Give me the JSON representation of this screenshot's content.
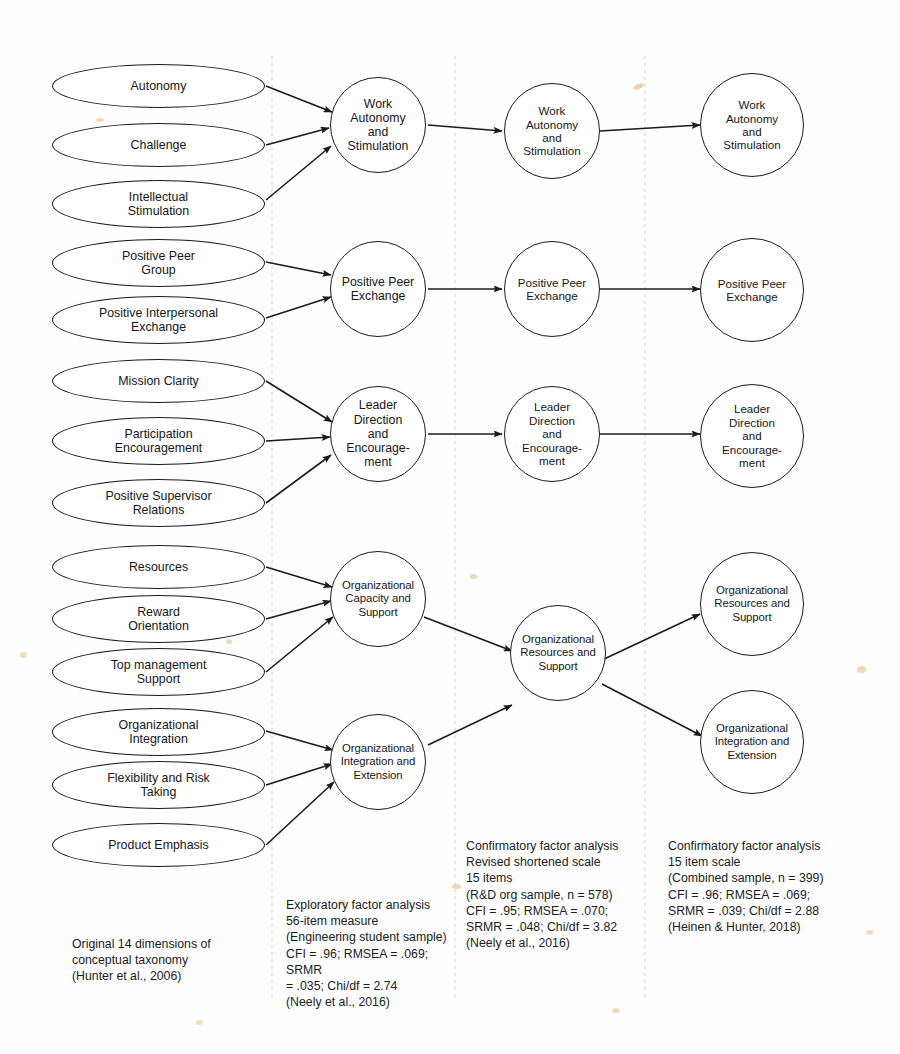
{
  "figure": {
    "type": "path-diagram",
    "title_clipped_top": "",
    "background": "#fefefe",
    "stroke_color": "#1a1a1a",
    "divider_color": "#d9d9d9"
  },
  "columns": [
    {
      "id": "col1",
      "label": "Original 14 dimensions of conceptual taxonomy"
    },
    {
      "id": "col2",
      "label": "Exploratory factor analysis"
    },
    {
      "id": "col3",
      "label": "Confirmatory factor analysis - revised shortened scale"
    },
    {
      "id": "col4",
      "label": "Confirmatory factor analysis - 15 item scale"
    }
  ],
  "dimensions": [
    {
      "id": "d1",
      "label": "Autonomy",
      "x": 52,
      "y": 64,
      "w": 213,
      "h": 44
    },
    {
      "id": "d2",
      "label": "Challenge",
      "x": 52,
      "y": 123,
      "w": 213,
      "h": 44
    },
    {
      "id": "d3",
      "label": "Intellectual\nStimulation",
      "x": 52,
      "y": 180,
      "w": 213,
      "h": 48
    },
    {
      "id": "d4",
      "label": "Positive Peer\nGroup",
      "x": 52,
      "y": 239,
      "w": 213,
      "h": 48
    },
    {
      "id": "d5",
      "label": "Positive Interpersonal\nExchange",
      "x": 52,
      "y": 296,
      "w": 213,
      "h": 48
    },
    {
      "id": "d6",
      "label": "Mission Clarity",
      "x": 52,
      "y": 359,
      "w": 213,
      "h": 44
    },
    {
      "id": "d7",
      "label": "Participation\nEncouragement",
      "x": 52,
      "y": 417,
      "w": 213,
      "h": 48
    },
    {
      "id": "d8",
      "label": "Positive Supervisor\nRelations",
      "x": 52,
      "y": 479,
      "w": 213,
      "h": 48
    },
    {
      "id": "d9",
      "label": "Resources",
      "x": 52,
      "y": 545,
      "w": 213,
      "h": 44
    },
    {
      "id": "d10",
      "label": "Reward\nOrientation",
      "x": 52,
      "y": 595,
      "w": 213,
      "h": 48
    },
    {
      "id": "d11",
      "label": "Top management\nSupport",
      "x": 52,
      "y": 648,
      "w": 213,
      "h": 48
    },
    {
      "id": "d12",
      "label": "Organizational\nIntegration",
      "x": 52,
      "y": 708,
      "w": 213,
      "h": 48
    },
    {
      "id": "d13",
      "label": "Flexibility and Risk\nTaking",
      "x": 52,
      "y": 761,
      "w": 213,
      "h": 48
    },
    {
      "id": "d14",
      "label": "Product Emphasis",
      "x": 52,
      "y": 823,
      "w": 213,
      "h": 44
    }
  ],
  "efa_factors": [
    {
      "id": "e1",
      "label": "Work\nAutonomy\nand\nStimulation",
      "x": 330,
      "y": 77,
      "size": 96
    },
    {
      "id": "e2",
      "label": "Positive Peer\nExchange",
      "x": 330,
      "y": 241,
      "size": 96
    },
    {
      "id": "e3",
      "label": "Leader\nDirection\nand\nEncourage-\nment",
      "x": 330,
      "y": 386,
      "size": 96
    },
    {
      "id": "e4",
      "label": "Organizational\nCapacity and\nSupport",
      "x": 330,
      "y": 551,
      "size": 96
    },
    {
      "id": "e5",
      "label": "Organizational\nIntegration and\nExtension",
      "x": 330,
      "y": 714,
      "size": 96
    }
  ],
  "cfa1_factors": [
    {
      "id": "c1",
      "label": "Work\nAutonomy\nand\nStimulation",
      "x": 504,
      "y": 83,
      "size": 96
    },
    {
      "id": "c2",
      "label": "Positive Peer\nExchange",
      "x": 504,
      "y": 241,
      "size": 96
    },
    {
      "id": "c3",
      "label": "Leader\nDirection\nand\nEncourage-\nment",
      "x": 504,
      "y": 386,
      "size": 96
    },
    {
      "id": "c4",
      "label": "Organizational\nResources and\nSupport",
      "x": 510,
      "y": 605,
      "size": 96
    }
  ],
  "cfa2_factors": [
    {
      "id": "f1",
      "label": "Work\nAutonomy\nand\nStimulation",
      "x": 700,
      "y": 73,
      "size": 104
    },
    {
      "id": "f2",
      "label": "Positive Peer\nExchange",
      "x": 700,
      "y": 238,
      "size": 104
    },
    {
      "id": "f3",
      "label": "Leader\nDirection\nand\nEncourage-\nment",
      "x": 700,
      "y": 384,
      "size": 104
    },
    {
      "id": "f4",
      "label": "Organizational\nResources and\nSupport",
      "x": 700,
      "y": 552,
      "size": 104
    },
    {
      "id": "f5",
      "label": "Organizational\nIntegration and\nExtension",
      "x": 700,
      "y": 690,
      "size": 104
    }
  ],
  "captions": {
    "col1": "Original 14 dimensions of\nconceptual taxonomy\n(Hunter et al., 2006)",
    "col2": "Exploratory factor analysis\n56-item measure\n(Engineering student sample)\nCFI = .96; RMSEA = .069; SRMR\n= .035; Chi/df = 2.74\n(Neely et al., 2016)",
    "col3": "Confirmatory factor analysis\nRevised shortened scale\n15 items\n(R&D org sample, n = 578)\nCFI = .95; RMSEA = .070;\nSRMR = .048; Chi/df = 3.82\n(Neely et al., 2016)",
    "col4": "Confirmatory factor analysis\n15 item scale\n(Combined sample, n = 399)\nCFI = .96; RMSEA = .069;\nSRMR = .039; Chi/df = 2.88\n(Heinen & Hunter, 2018)"
  },
  "fit_statistics": [
    {
      "column": "col2",
      "analysis": "Exploratory factor analysis",
      "measure": "56-item measure",
      "sample": "Engineering student sample",
      "n": null,
      "CFI": ".96",
      "RMSEA": ".069",
      "SRMR": ".035",
      "Chi_df": "2.74",
      "citation": "Neely et al., 2016"
    },
    {
      "column": "col3",
      "analysis": "Confirmatory factor analysis",
      "measure": "Revised shortened scale 15 items",
      "sample": "R&D org sample",
      "n": "578",
      "CFI": ".95",
      "RMSEA": ".070",
      "SRMR": ".048",
      "Chi_df": "3.82",
      "citation": "Neely et al., 2016"
    },
    {
      "column": "col4",
      "analysis": "Confirmatory factor analysis",
      "measure": "15 item scale",
      "sample": "Combined sample",
      "n": "399",
      "CFI": ".96",
      "RMSEA": ".069",
      "SRMR": ".039",
      "Chi_df": "2.88",
      "citation": "Heinen & Hunter, 2018"
    }
  ]
}
